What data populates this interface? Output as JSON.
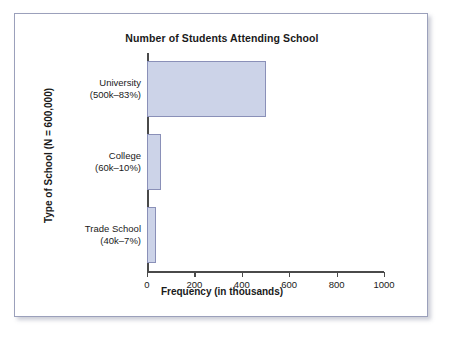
{
  "figure": {
    "background_color": "#ffffff",
    "frame_color": "#9ba0bb"
  },
  "chart_data": {
    "type": "bar",
    "orientation": "horizontal",
    "title": "Number of Students Attending School",
    "xlabel": "Frequency (in thousands)",
    "ylabel": "Type of School (N = 600,000)",
    "categories": [
      "University",
      "College",
      "Trade School"
    ],
    "category_labels": [
      {
        "name": "University",
        "detail": "(500k–83%)"
      },
      {
        "name": "College",
        "detail": "(60k–10%)"
      },
      {
        "name": "Trade School",
        "detail": "(40k–7%)"
      }
    ],
    "values": [
      500,
      60,
      40
    ],
    "value_units": "thousands",
    "percentages": [
      83,
      10,
      7
    ],
    "counts": [
      500000,
      60000,
      40000
    ],
    "total_n": 600000,
    "xlim": [
      0,
      1000
    ],
    "xticks": [
      0,
      200,
      400,
      600,
      800,
      1000
    ],
    "xtick_labels": [
      "0",
      "200",
      "400",
      "600",
      "800",
      "1000"
    ],
    "grid": false,
    "legend": null,
    "bar_fill_color": "#ccd3e8",
    "bar_border_color": "#8a90b8",
    "axis_color": "#4a4a4a"
  }
}
